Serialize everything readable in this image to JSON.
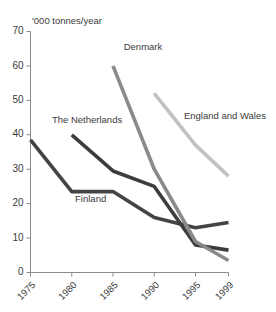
{
  "chart_data": {
    "type": "line",
    "title": "",
    "subtitle": "",
    "xlabel": "",
    "ylabel": "'000 tonnes/year",
    "x": [
      1975,
      1980,
      1985,
      1990,
      1995,
      1999
    ],
    "xticklabels": [
      "1975",
      "1980",
      "1985",
      "1990",
      "1995",
      "1999"
    ],
    "yticklabels": [
      "0",
      "10",
      "20",
      "30",
      "40",
      "50",
      "60",
      "70"
    ],
    "yticks": [
      0,
      10,
      20,
      30,
      40,
      50,
      60,
      70
    ],
    "ylim": [
      0,
      70
    ],
    "xlim": [
      1975,
      1999
    ],
    "grid": false,
    "legend_position": "inline-labels",
    "series": [
      {
        "name": "Finland",
        "color": "#444444",
        "width": 3.6,
        "x": [
          1975,
          1980,
          1985,
          1990,
          1995,
          1999
        ],
        "values": [
          38.5,
          23.5,
          23.5,
          16,
          13,
          14.5
        ],
        "label_x": 1980.4,
        "label_y": 20.5,
        "label_anchor": "start"
      },
      {
        "name": "The Netherlands",
        "color": "#3d3d3d",
        "width": 3.6,
        "x": [
          1980,
          1985,
          1990,
          1995,
          1999
        ],
        "values": [
          40,
          29.5,
          25,
          8,
          6.5
        ],
        "label_x": 1977.6,
        "label_y": 43.5,
        "label_anchor": "start"
      },
      {
        "name": "Denmark",
        "color": "#8a8a8a",
        "width": 3.6,
        "x": [
          1985,
          1990,
          1995,
          1999
        ],
        "values": [
          60,
          30,
          9,
          3.5
        ],
        "label_x": 1986.3,
        "label_y": 64.5,
        "label_anchor": "start"
      },
      {
        "name": "England and Wales",
        "color": "#c2c2c2",
        "width": 3.6,
        "x": [
          1990,
          1995,
          1999
        ],
        "values": [
          52,
          37,
          28
        ],
        "label_x": 1993.6,
        "label_y": 44.5,
        "label_anchor": "start"
      }
    ]
  }
}
